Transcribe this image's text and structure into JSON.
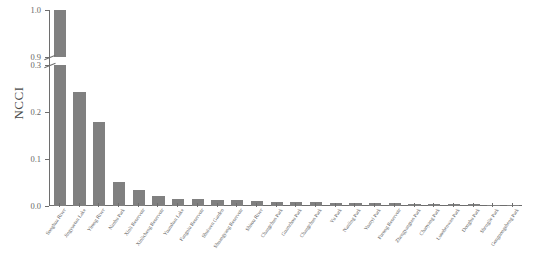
{
  "chart_data": {
    "type": "bar",
    "title": "",
    "xlabel": "",
    "ylabel": "NCCI",
    "grid": false,
    "legend": false,
    "bar_color": "#808080",
    "axis_color": "#6e6e6e",
    "broken_axis": true,
    "axis_break": {
      "lower_max": 0.3,
      "upper_min": 0.9
    },
    "ylim_lower": [
      0.0,
      0.3
    ],
    "ylim_upper": [
      0.9,
      1.0
    ],
    "yticks_upper": [
      "1.0",
      "0.9"
    ],
    "yticks_lower": [
      "0.3",
      "0.2",
      "0.1",
      "0.0"
    ],
    "ytick_values_upper": [
      1.0,
      0.9
    ],
    "ytick_values_lower": [
      0.3,
      0.2,
      0.1,
      0.0
    ],
    "categories": [
      "Songhua River",
      "Jingyuetan Lake",
      "Yitong River",
      "Nanhu Park",
      "Xinli Reservoir",
      "Xinlicheng Reservoir",
      "Yuanshan Lake",
      "Fangniu Reservoir",
      "Shuiwen Garden",
      "Shuangyang Reservoir",
      "Shitou River",
      "Changchun Park",
      "Guanzhou Park",
      "Changchun Park",
      "Yu Park",
      "Nanling Park",
      "Yuanyi Park",
      "Furong Reservoir",
      "Zhengyangtan Park",
      "Chaoyang Park",
      "Luoshenwan Park",
      "Donghu Park",
      "Shenglie Park",
      "Gongnongsheng Park"
    ],
    "values": [
      1.0,
      0.243,
      0.178,
      0.052,
      0.035,
      0.022,
      0.015,
      0.014,
      0.013,
      0.012,
      0.01,
      0.009,
      0.008,
      0.008,
      0.007,
      0.007,
      0.006,
      0.006,
      0.005,
      0.005,
      0.004,
      0.004,
      0.003,
      0.003
    ]
  }
}
